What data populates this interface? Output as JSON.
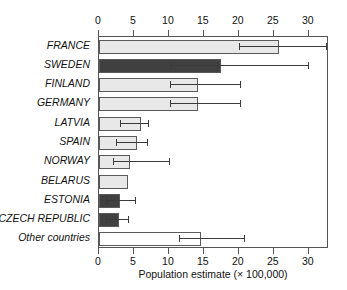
{
  "chart_data": {
    "type": "bar",
    "orientation": "horizontal",
    "title": "",
    "xlabel": "Population estimate (× 100,000)",
    "ylabel": "",
    "xlim": [
      0,
      32.9
    ],
    "xticks": [
      0,
      5,
      10,
      15,
      20,
      25,
      30
    ],
    "xticklabels": [
      "0",
      "5",
      "10",
      "15",
      "20",
      "25",
      "30"
    ],
    "grid": false,
    "legend": "none",
    "categories": [
      "FRANCE",
      "SWEDEN",
      "FINLAND",
      "GERMANY",
      "LATVIA",
      "SPAIN",
      "NORWAY",
      "BELARUS",
      "ESTONIA",
      "CZECH REPUBLIC",
      "Other countries"
    ],
    "values": [
      25.8,
      17.5,
      14.2,
      14.2,
      6.0,
      5.5,
      4.5,
      4.2,
      3.0,
      2.8,
      14.6
    ],
    "error_low": [
      20.0,
      10.2,
      10.2,
      10.2,
      3.0,
      2.4,
      2.0,
      null,
      1.0,
      1.0,
      11.5
    ],
    "error_high": [
      32.5,
      29.9,
      20.1,
      20.1,
      7.0,
      6.8,
      10.0,
      null,
      5.2,
      4.2,
      20.8
    ],
    "bar_colors": [
      "#e8e8e8",
      "#404040",
      "#e8e8e8",
      "#e8e8e8",
      "#e8e8e8",
      "#e8e8e8",
      "#e8e8e8",
      "#e8e8e8",
      "#404040",
      "#404040",
      "#ffffff"
    ]
  },
  "colors": {
    "light_bar": "#e8e8e8",
    "dark_bar": "#404040",
    "white_bar": "#ffffff",
    "bar_outline": "#5a5a5a",
    "axis": "#555555",
    "error": "#3a3a3a",
    "text": "#111111",
    "background": "#ffffff"
  }
}
